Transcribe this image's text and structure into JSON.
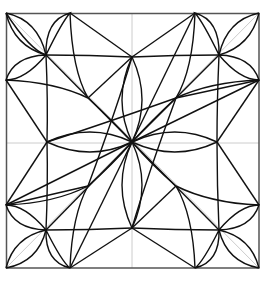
{
  "figure": {
    "colors": {
      "background": "#ffffff",
      "stroke": "#111111",
      "frame": "#555555",
      "guide": "#cccccc"
    },
    "square": {
      "x": 6,
      "y": 13,
      "width": 253,
      "height": 255
    },
    "center": [
      132,
      142
    ],
    "corner_flower_centers": [
      [
        46,
        55
      ],
      [
        219,
        55
      ],
      [
        46,
        230
      ],
      [
        219,
        230
      ]
    ],
    "star_tips": [
      [
        132,
        57
      ],
      [
        47,
        142
      ],
      [
        217,
        142
      ],
      [
        132,
        228
      ]
    ],
    "inner_vertices": [
      [
        88,
        98
      ],
      [
        176,
        98
      ],
      [
        88,
        186
      ],
      [
        176,
        186
      ]
    ]
  }
}
